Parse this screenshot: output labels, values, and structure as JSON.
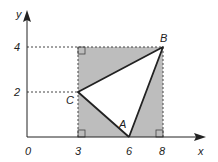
{
  "diagram": {
    "type": "coordinate-geometry",
    "axes": {
      "x_label": "x",
      "y_label": "y",
      "origin_label": "0",
      "x_ticks": [
        "3",
        "6",
        "8"
      ],
      "y_ticks": [
        "2",
        "4"
      ]
    },
    "rectangle": {
      "corners": [
        [
          3,
          0
        ],
        [
          8,
          0
        ],
        [
          8,
          4
        ],
        [
          3,
          4
        ]
      ],
      "fill": "#bdbdbd"
    },
    "triangle": {
      "vertices": {
        "A": [
          6,
          0
        ],
        "B": [
          8,
          4
        ],
        "C": [
          3,
          2
        ]
      }
    },
    "point_labels": {
      "A": "A",
      "B": "B",
      "C": "C"
    },
    "colors": {
      "stroke": "#222222",
      "shade": "#bdbdbd",
      "dashed": "#444444"
    }
  }
}
